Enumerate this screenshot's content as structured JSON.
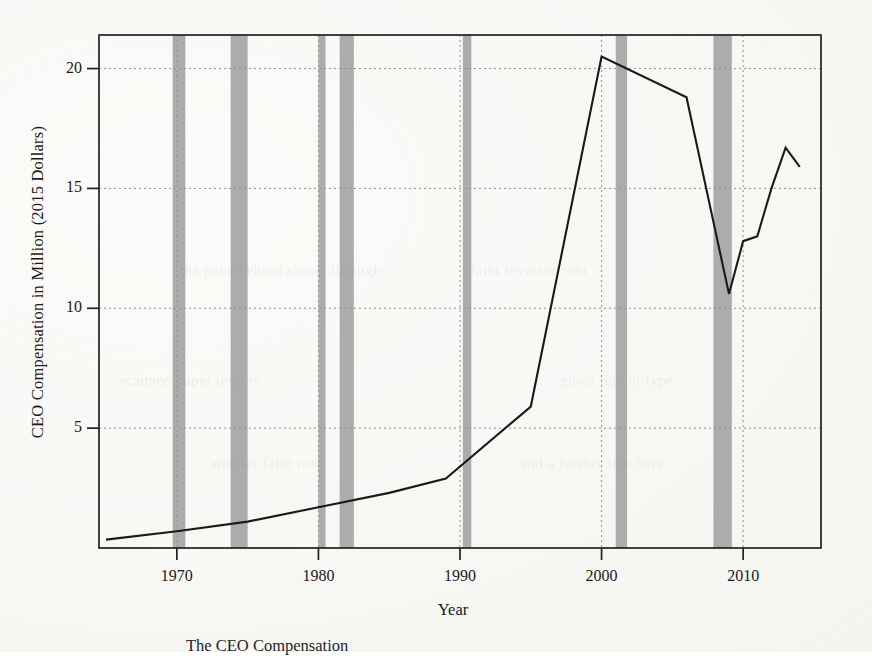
{
  "figure": {
    "caption_partial": "The CEO Compensation"
  },
  "chart_data": {
    "type": "line",
    "title": "",
    "xlabel": "Year",
    "ylabel": "CEO Compensation in Million (2015 Dollars)",
    "xlim": [
      1964.5,
      2015.5
    ],
    "ylim": [
      0,
      21.4
    ],
    "xticks": [
      "1970",
      "1980",
      "1990",
      "2000",
      "2010"
    ],
    "xtick_values": [
      1970,
      1980,
      1990,
      2000,
      2010
    ],
    "yticks": [
      "5",
      "10",
      "15",
      "20"
    ],
    "ytick_values": [
      5,
      10,
      15,
      20
    ],
    "grid": "dotted-both",
    "legend": "none",
    "line_color": "#1a1a1a",
    "band_color": "#a8a8a8",
    "series": [
      {
        "name": "CEO Compensation",
        "x": [
          1965,
          1970,
          1975,
          1980,
          1985,
          1989,
          1995,
          2000,
          2006,
          2009,
          2010,
          2011,
          2012,
          2013,
          2014
        ],
        "values": [
          0.35,
          0.7,
          1.1,
          1.7,
          2.3,
          2.9,
          5.9,
          20.5,
          18.8,
          10.6,
          12.8,
          13.0,
          15.0,
          16.7,
          15.9
        ]
      }
    ],
    "recession_bands": [
      {
        "start": 1969.7,
        "end": 1970.6
      },
      {
        "start": 1973.8,
        "end": 1975.0
      },
      {
        "start": 1980.0,
        "end": 1980.5
      },
      {
        "start": 1981.5,
        "end": 1982.5
      },
      {
        "start": 1990.2,
        "end": 1990.8
      },
      {
        "start": 2001.0,
        "end": 2001.8
      },
      {
        "start": 2007.9,
        "end": 2009.2
      }
    ]
  },
  "bleed_through": [
    {
      "text": "the page behind shows through",
      "x": 180,
      "y": 262
    },
    {
      "text": "faint reversed text",
      "x": 470,
      "y": 262
    },
    {
      "text": "scanned paper texture",
      "x": 120,
      "y": 372
    },
    {
      "text": "ghost line of type",
      "x": 560,
      "y": 372
    },
    {
      "text": "another faint row",
      "x": 210,
      "y": 455
    },
    {
      "text": "and a further line here",
      "x": 520,
      "y": 455
    }
  ]
}
